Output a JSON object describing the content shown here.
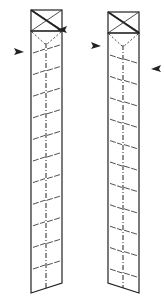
{
  "diagram": {
    "type": "fold-instructions",
    "colors": {
      "line": "#222222",
      "background": "#ffffff"
    },
    "strips": [
      {
        "id": "left-strip",
        "x": 31,
        "width": 31,
        "box": {
          "top": 10,
          "height": 21
        },
        "body_top": 31,
        "bottom_left": 293,
        "bottom_right": 283,
        "center_x": 46,
        "fold_line_count": 11,
        "fold_slope": "up-right",
        "arrows": [
          {
            "x": 64,
            "y": 30,
            "direction": "left"
          },
          {
            "x": 17,
            "y": 52,
            "direction": "right"
          }
        ]
      },
      {
        "id": "right-strip",
        "x": 108,
        "width": 31,
        "box": {
          "top": 12,
          "height": 21
        },
        "body_top": 33,
        "bottom_left": 283,
        "bottom_right": 293,
        "center_x": 123,
        "fold_line_count": 11,
        "fold_slope": "down-right",
        "arrows": [
          {
            "x": 94,
            "y": 46,
            "direction": "right"
          },
          {
            "x": 158,
            "y": 69,
            "direction": "left"
          }
        ]
      }
    ]
  }
}
